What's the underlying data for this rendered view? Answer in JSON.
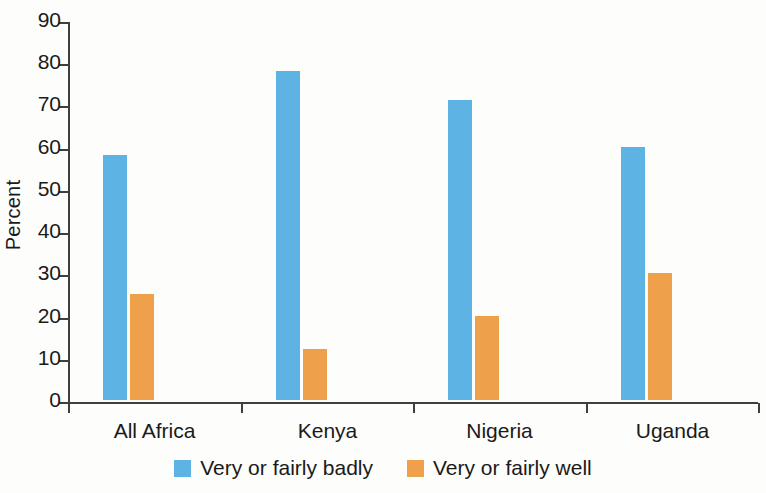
{
  "chart_data": {
    "type": "bar",
    "title": "",
    "xlabel": "",
    "ylabel": "Percent",
    "ylim": [
      0,
      90
    ],
    "ytick_step": 10,
    "yticks": [
      90,
      80,
      70,
      60,
      50,
      40,
      30,
      20,
      10,
      0
    ],
    "grid": false,
    "legend_position": "bottom-center",
    "categories": [
      "All Africa",
      "Kenya",
      "Nigeria",
      "Uganda"
    ],
    "series": [
      {
        "name": "Very or fairly badly",
        "color": "#5cb3e4",
        "values": [
          58,
          78,
          71,
          60
        ]
      },
      {
        "name": "Very or fairly well",
        "color": "#efa04a",
        "values": [
          25,
          12,
          20,
          30
        ]
      }
    ]
  },
  "colors": {
    "series_badly": "#5cb3e4",
    "series_well": "#efa04a",
    "axis": "#3f3f3f",
    "text": "#1a1a1a",
    "background": "#fdfdfb"
  }
}
